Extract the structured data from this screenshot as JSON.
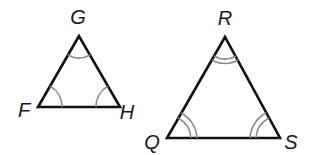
{
  "diagram": {
    "type": "similar-triangles",
    "colors": {
      "side": "#111111",
      "arc": "#8a8a8a",
      "label": "#1a1a1a",
      "background": "#ffffff"
    },
    "triangles": [
      {
        "name": "triangle-FGH",
        "angle_mark_arcs": 1,
        "vertices": [
          {
            "label": "G",
            "x": 79,
            "y": 36,
            "lx": 78,
            "ly": 24
          },
          {
            "label": "F",
            "x": 38,
            "y": 107,
            "lx": 24,
            "ly": 117
          },
          {
            "label": "H",
            "x": 120,
            "y": 107,
            "lx": 126,
            "ly": 119
          }
        ]
      },
      {
        "name": "triangle-QRS",
        "angle_mark_arcs": 2,
        "vertices": [
          {
            "label": "R",
            "x": 225,
            "y": 37,
            "lx": 225,
            "ly": 25
          },
          {
            "label": "Q",
            "x": 167,
            "y": 138,
            "lx": 151,
            "ly": 149
          },
          {
            "label": "S",
            "x": 280,
            "y": 138,
            "lx": 286,
            "ly": 149
          }
        ]
      }
    ]
  }
}
